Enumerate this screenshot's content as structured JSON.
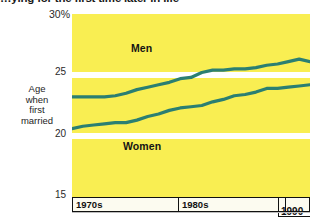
{
  "title": "…ying for the first time later in life",
  "y_axis": {
    "label_lines": [
      "Age",
      "when",
      "first",
      "married"
    ],
    "ticks": [
      "30%",
      "25",
      "20",
      "15"
    ]
  },
  "x_axis": {
    "boxes": [
      "1970s",
      "1980s",
      "1990"
    ],
    "label_1990": "1990"
  },
  "series_labels": {
    "men": "Men",
    "women": "Women"
  },
  "colors": {
    "plot_background": "#f9ee52",
    "line": "#2b7f72",
    "gridline": "#ffffff",
    "axis_box_fill": "#fcfbf0",
    "text": "#111111"
  },
  "chart_data": {
    "type": "line",
    "title": "…ying for the first time later in life",
    "xlabel": "",
    "ylabel": "Age when first married",
    "ylim": [
      15,
      30
    ],
    "yticks": [
      15,
      20,
      25,
      30
    ],
    "ytick_labels": [
      "15",
      "20",
      "25",
      "30%"
    ],
    "grid": true,
    "gridlines_at": [
      20,
      25
    ],
    "legend_position": "inline-labels",
    "xlim": [
      1970,
      1992
    ],
    "x_period_boxes": [
      {
        "label": "1970s",
        "start": 1970,
        "end": 1980
      },
      {
        "label": "1980s",
        "start": 1980,
        "end": 1990
      },
      {
        "label": "1990",
        "start": 1990,
        "end": 1992
      }
    ],
    "x": [
      1970,
      1971,
      1972,
      1973,
      1974,
      1975,
      1976,
      1977,
      1978,
      1979,
      1980,
      1981,
      1982,
      1983,
      1984,
      1985,
      1986,
      1987,
      1988,
      1989,
      1990,
      1991,
      1992
    ],
    "series": [
      {
        "name": "Men",
        "color": "#2b7f72",
        "values": [
          23.2,
          23.2,
          23.2,
          23.2,
          23.3,
          23.5,
          23.8,
          24.0,
          24.2,
          24.4,
          24.7,
          24.8,
          25.2,
          25.4,
          25.4,
          25.5,
          25.5,
          25.6,
          25.8,
          25.9,
          26.1,
          26.3,
          26.1
        ]
      },
      {
        "name": "Women",
        "color": "#2b7f72",
        "values": [
          20.6,
          20.8,
          20.9,
          21.0,
          21.1,
          21.1,
          21.3,
          21.6,
          21.8,
          22.1,
          22.3,
          22.4,
          22.5,
          22.8,
          23.0,
          23.3,
          23.4,
          23.6,
          23.9,
          23.9,
          24.0,
          24.1,
          24.2
        ]
      }
    ]
  }
}
